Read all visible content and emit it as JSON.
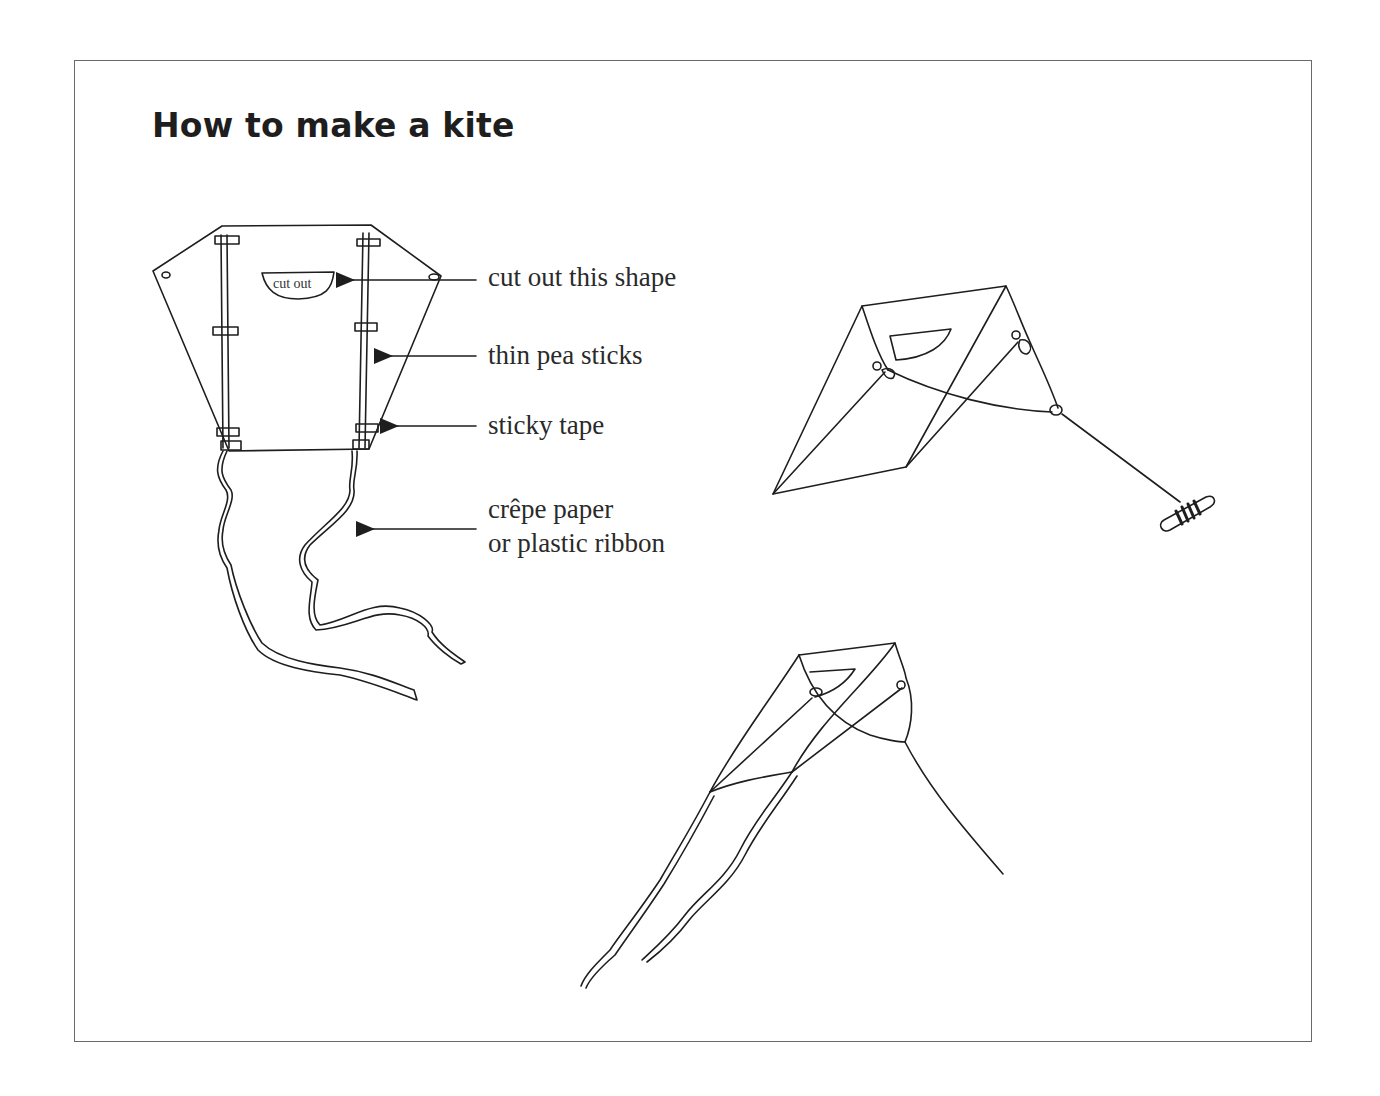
{
  "title": "How to make a kite",
  "kite_diagram": {
    "cutout_label": "cut out",
    "callouts": [
      {
        "id": "cutout",
        "text": "cut out this shape"
      },
      {
        "id": "sticks",
        "text": "thin pea sticks"
      },
      {
        "id": "tape",
        "text": "sticky tape"
      },
      {
        "id": "tail_line1",
        "text": "crêpe paper"
      },
      {
        "id": "tail_line2",
        "text": "or plastic ribbon"
      }
    ]
  },
  "illustrations": [
    "flat-kite-with-labels",
    "kite-in-flight-with-reel",
    "kite-in-flight-with-tails"
  ],
  "colors": {
    "ink": "#1e1e1e",
    "frame": "#6a6a6a",
    "background": "#ffffff"
  }
}
